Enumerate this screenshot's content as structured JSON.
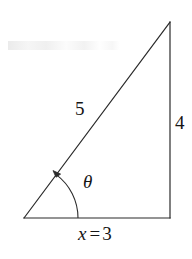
{
  "figure": {
    "stroke_color": "#2b2b2b",
    "text_color": "#151515",
    "background_color": "#ffffff",
    "labels": {
      "hypotenuse": "5",
      "opposite": "4",
      "angle": "θ",
      "base_variable": "x",
      "base_equals": "=",
      "base_value": "3"
    },
    "geometry": {
      "vertex_left": [
        24,
        218
      ],
      "vertex_right": [
        170,
        218
      ],
      "vertex_apex": [
        170,
        22
      ],
      "arc_radius": 54
    }
  }
}
